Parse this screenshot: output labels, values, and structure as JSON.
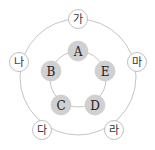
{
  "diagram": {
    "outer_nodes": [
      {
        "id": "ga",
        "label": "가"
      },
      {
        "id": "ma",
        "label": "마"
      },
      {
        "id": "ra",
        "label": "라"
      },
      {
        "id": "da",
        "label": "다"
      },
      {
        "id": "na",
        "label": "나"
      }
    ],
    "inner_nodes": [
      {
        "id": "A",
        "label": "A"
      },
      {
        "id": "E",
        "label": "E"
      },
      {
        "id": "D",
        "label": "D"
      },
      {
        "id": "C",
        "label": "C"
      },
      {
        "id": "B",
        "label": "B"
      }
    ],
    "colors": {
      "inner_fill": "#d0d0d0",
      "outer_fill": "#ffffff",
      "ring_stroke": "#b5b5b5"
    }
  }
}
